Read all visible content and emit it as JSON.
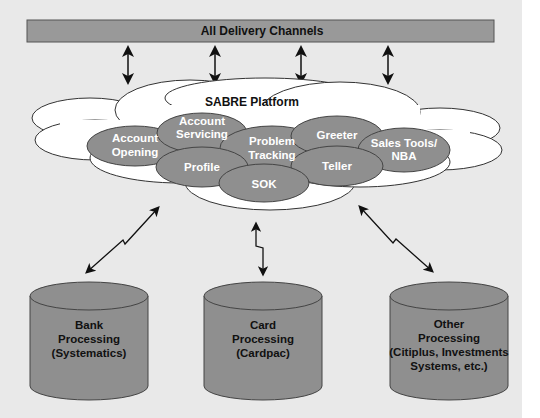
{
  "diagram": {
    "top_bar": {
      "label": "All Delivery Channels",
      "color": "#999999"
    },
    "platform": {
      "label": "SABRE Platform",
      "modules": [
        {
          "label_line1": "Account",
          "label_line2": "Opening"
        },
        {
          "label_line1": "Account",
          "label_line2": "Servicing"
        },
        {
          "label_line1": "Problem",
          "label_line2": "Tracking"
        },
        {
          "label_line1": "Greeter",
          "label_line2": ""
        },
        {
          "label_line1": "Sales Tools/",
          "label_line2": "NBA"
        },
        {
          "label_line1": "Profile",
          "label_line2": ""
        },
        {
          "label_line1": "Teller",
          "label_line2": ""
        },
        {
          "label_line1": "SOK",
          "label_line2": ""
        }
      ],
      "module_color": "#8f8f8f"
    },
    "backends": [
      {
        "line1": "Bank",
        "line2": "Processing",
        "line3": "(Systematics)",
        "line4": ""
      },
      {
        "line1": "Card",
        "line2": "Processing",
        "line3": "(Cardpac)",
        "line4": ""
      },
      {
        "line1": "Other",
        "line2": "Processing",
        "line3": "(Citiplus, Investments",
        "line4": "Systems, etc.)"
      }
    ],
    "backend_color": "#8f8f8f",
    "connections": {
      "channel_arrows": 4,
      "backend_links": [
        "bidirectional lightning",
        "bidirectional lightning",
        "bidirectional lightning"
      ]
    }
  }
}
